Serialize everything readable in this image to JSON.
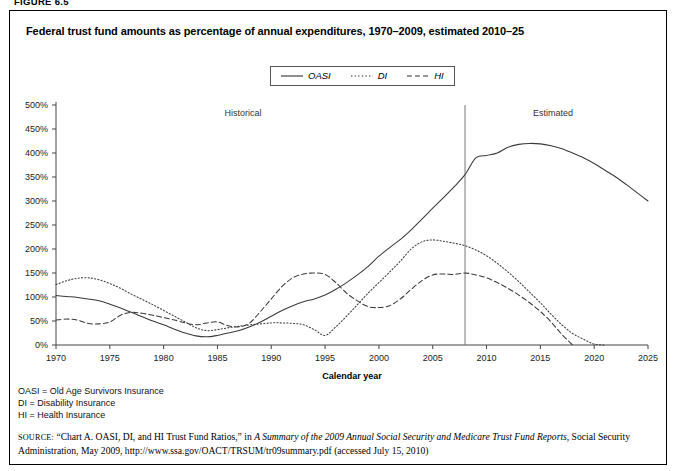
{
  "figure": {
    "label": "FIGURE 6.5"
  },
  "title": "Federal trust fund amounts as percentage of annual expenditures, 1970–2009, estimated 2010–25",
  "legend": {
    "items": [
      {
        "label": "OASI",
        "style": "solid"
      },
      {
        "label": "DI",
        "style": "dotted"
      },
      {
        "label": "HI",
        "style": "dashed"
      }
    ]
  },
  "annotations": {
    "historical": "Historical",
    "estimated": "Estimated",
    "divider_year": 2008
  },
  "notes": [
    "OASI = Old Age Survivors Insurance",
    "DI = Disability Insurance",
    "HI = Health Insurance"
  ],
  "source": {
    "prefix": "SOURCE:",
    "part1": " “Chart A. OASI, DI, and HI Trust Fund Ratios,” in ",
    "italic": "A Summary of the 2009 Annual Social Security and Medicare Trust Fund Reports",
    "part2": ", Social Security Administration, May 2009, http://www.ssa.gov/OACT/TRSUM/tr09summary.pdf (accessed July 15, 2010)"
  },
  "chart_data": {
    "type": "line",
    "title": "Federal trust fund amounts as percentage of annual expenditures, 1970–2009, estimated 2010–25",
    "xlabel": "Calendar year",
    "ylabel": "",
    "xlim": [
      1970,
      2025
    ],
    "ylim": [
      0,
      500
    ],
    "ytick_labels": [
      "0%",
      "50%",
      "100%",
      "150%",
      "200%",
      "250%",
      "300%",
      "350%",
      "400%",
      "450%",
      "500%"
    ],
    "yticks": [
      0,
      50,
      100,
      150,
      200,
      250,
      300,
      350,
      400,
      450,
      500
    ],
    "xticks": [
      1970,
      1975,
      1980,
      1985,
      1990,
      1995,
      2000,
      2005,
      2010,
      2015,
      2020,
      2025
    ],
    "grid": false,
    "legend_position": "top-center",
    "x": [
      1970,
      1971,
      1972,
      1973,
      1974,
      1975,
      1976,
      1977,
      1978,
      1979,
      1980,
      1981,
      1982,
      1983,
      1984,
      1985,
      1986,
      1987,
      1988,
      1989,
      1990,
      1991,
      1992,
      1993,
      1994,
      1995,
      1996,
      1997,
      1998,
      1999,
      2000,
      2001,
      2002,
      2003,
      2004,
      2005,
      2006,
      2007,
      2008,
      2009,
      2010,
      2011,
      2012,
      2013,
      2014,
      2015,
      2016,
      2017,
      2018,
      2019,
      2020,
      2021,
      2022,
      2023,
      2024,
      2025
    ],
    "series": [
      {
        "name": "OASI",
        "style": "solid",
        "values": [
          103,
          101,
          99,
          96,
          92,
          85,
          77,
          68,
          59,
          50,
          42,
          33,
          25,
          19,
          17,
          20,
          25,
          30,
          38,
          48,
          60,
          72,
          82,
          90,
          96,
          104,
          116,
          130,
          146,
          164,
          185,
          203,
          220,
          240,
          262,
          285,
          307,
          330,
          355,
          390,
          395,
          400,
          412,
          418,
          420,
          419,
          415,
          409,
          400,
          390,
          378,
          364,
          350,
          334,
          317,
          300
        ]
      },
      {
        "name": "DI",
        "style": "dotted",
        "values": [
          126,
          134,
          139,
          140,
          136,
          128,
          118,
          106,
          95,
          84,
          72,
          60,
          48,
          36,
          30,
          32,
          36,
          39,
          42,
          44,
          46,
          46,
          45,
          42,
          32,
          20,
          38,
          60,
          84,
          108,
          130,
          152,
          175,
          200,
          215,
          219,
          216,
          212,
          207,
          198,
          186,
          170,
          152,
          132,
          110,
          88,
          64,
          42,
          24,
          12,
          2,
          0,
          0,
          0,
          0,
          0
        ]
      },
      {
        "name": "HI",
        "style": "dashed",
        "values": [
          52,
          54,
          52,
          45,
          44,
          48,
          62,
          68,
          66,
          62,
          57,
          52,
          46,
          42,
          46,
          48,
          40,
          38,
          46,
          70,
          96,
          122,
          140,
          148,
          150,
          147,
          130,
          108,
          92,
          80,
          78,
          82,
          96,
          116,
          134,
          146,
          148,
          147,
          150,
          146,
          140,
          130,
          118,
          104,
          88,
          70,
          48,
          22,
          0,
          0,
          0,
          0,
          0,
          0,
          0,
          0
        ]
      }
    ]
  }
}
